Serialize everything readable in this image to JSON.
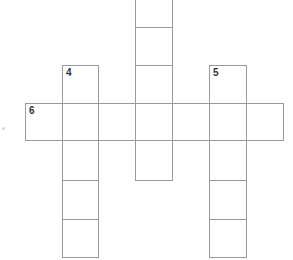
{
  "puzzle": {
    "type": "crossword",
    "cell_size": 37,
    "clue_numbers": {
      "down_4": "4",
      "down_5": "5",
      "across_6": "6"
    },
    "words": [
      {
        "id": "down-top",
        "number": "",
        "direction": "down",
        "length": 5
      },
      {
        "id": "down-4",
        "number": "4",
        "direction": "down",
        "length": 5
      },
      {
        "id": "down-5",
        "number": "5",
        "direction": "down",
        "length": 5
      },
      {
        "id": "across-6",
        "number": "6",
        "direction": "across",
        "length": 7
      }
    ],
    "colors": {
      "grid_line": "#9a9a9a",
      "cell_fill": "#ffffff",
      "number_text": "#333333"
    }
  }
}
